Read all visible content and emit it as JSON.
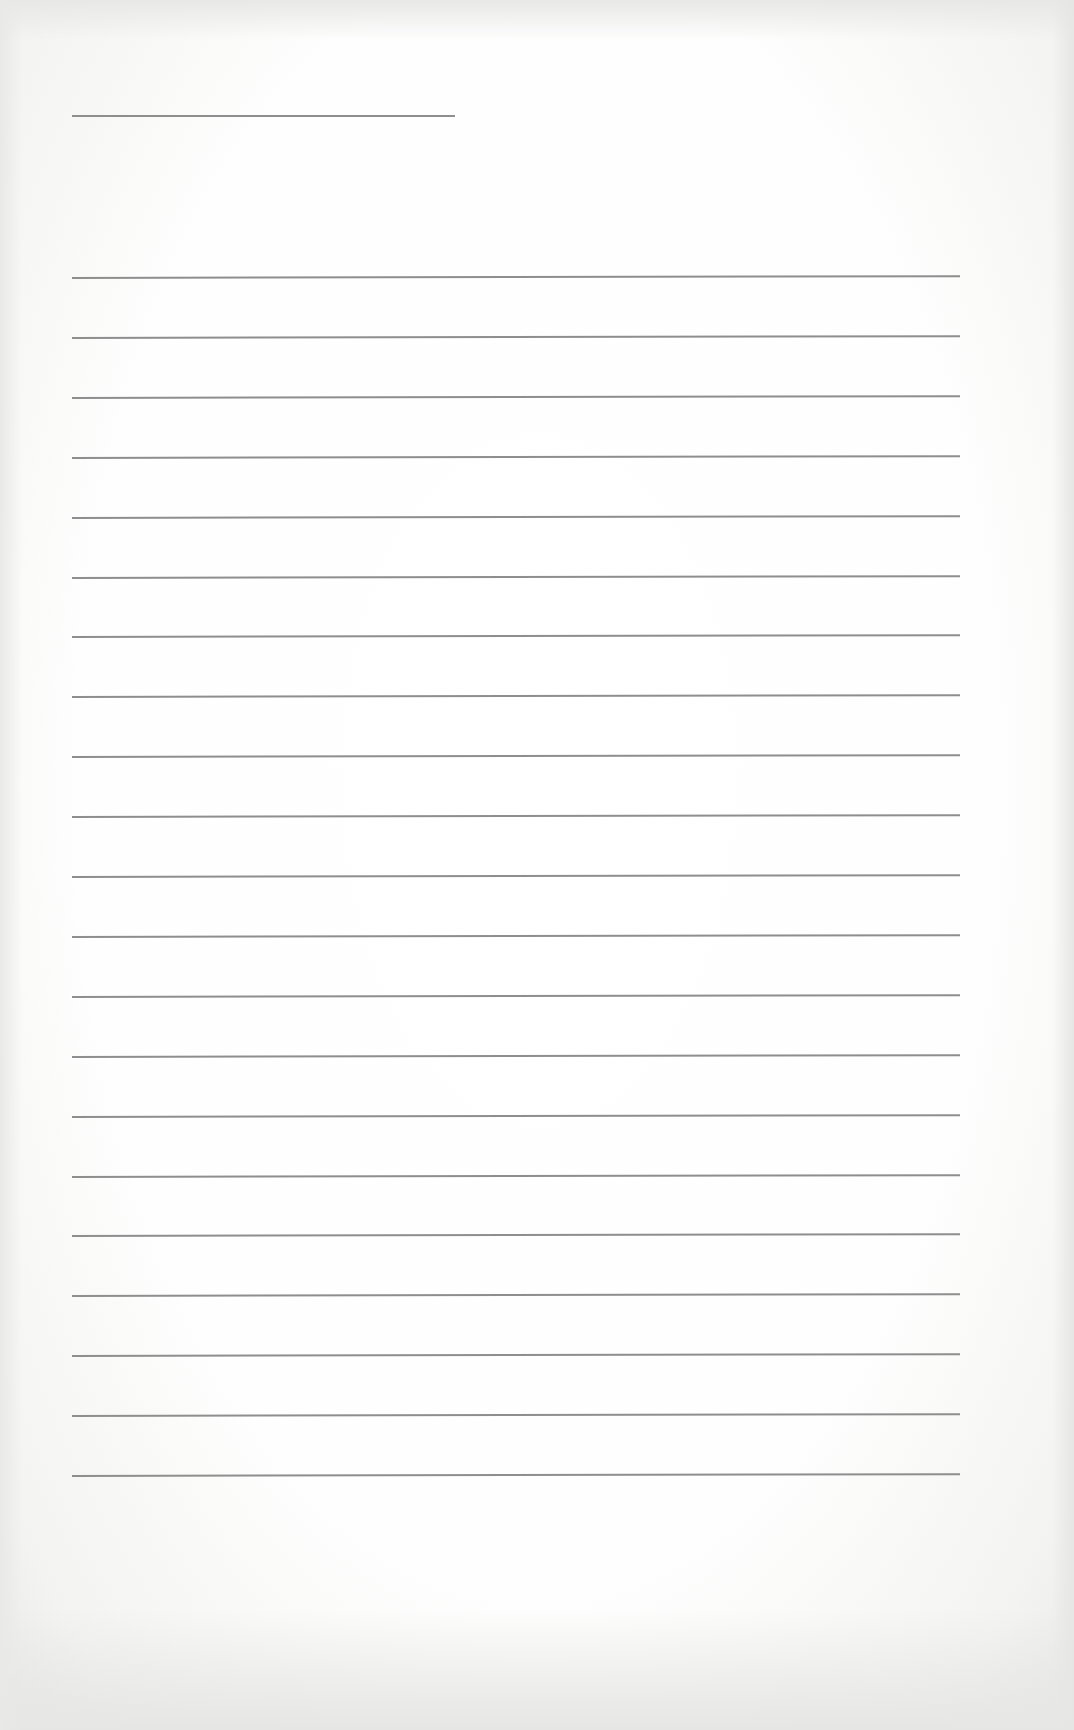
{
  "page": {
    "type": "blank lined writing paper",
    "background_color": "#fefefe",
    "line_color": "#8e8e8e",
    "title_line": {
      "x1": 72,
      "x2": 455,
      "y": 115
    },
    "ruled_lines": {
      "count": 21,
      "x1": 72,
      "x2": 960,
      "first_y": 277,
      "spacing": 59.9
    },
    "text_content": []
  }
}
